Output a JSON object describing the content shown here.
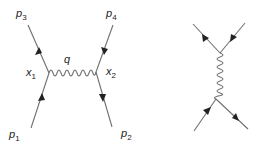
{
  "diagrams": [
    {
      "name": "labeled-feynman-diagram",
      "labels": {
        "p3": {
          "main": "p",
          "sub": "3"
        },
        "p4": {
          "main": "p",
          "sub": "4"
        },
        "p1": {
          "main": "p",
          "sub": "1"
        },
        "p2": {
          "main": "p",
          "sub": "2"
        },
        "x1": {
          "main": "x",
          "sub": "1"
        },
        "x2": {
          "main": "x",
          "sub": "2"
        },
        "q": {
          "main": "q"
        }
      }
    },
    {
      "name": "unlabeled-feynman-diagram"
    }
  ],
  "colors": {
    "line": "#707070",
    "arrow": "#222222",
    "text": "#222222",
    "background": "#ffffff"
  }
}
